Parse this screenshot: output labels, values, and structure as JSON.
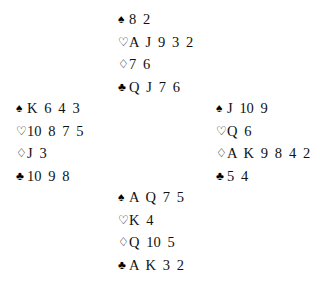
{
  "diagram": {
    "type": "bridge-deal",
    "background_color": "#ffffff",
    "ink_color": "#111111"
  },
  "suits": [
    {
      "key": "spades",
      "name": "spade-suit-symbol",
      "glyph": "♠",
      "filled": true,
      "label": "Spades"
    },
    {
      "key": "hearts",
      "name": "heart-suit-symbol",
      "glyph": "♡",
      "filled": false,
      "label": "Hearts"
    },
    {
      "key": "diamonds",
      "name": "diamond-suit-symbol",
      "glyph": "♢",
      "filled": false,
      "label": "Diamonds"
    },
    {
      "key": "clubs",
      "name": "club-suit-symbol",
      "glyph": "♣",
      "filled": true,
      "label": "Clubs"
    }
  ],
  "hands": {
    "north": {
      "position": "North",
      "spades": {
        "text": "8 2",
        "cards": [
          "8",
          "2"
        ]
      },
      "hearts": {
        "text": "A J 9 3 2",
        "cards": [
          "A",
          "J",
          "9",
          "3",
          "2"
        ]
      },
      "diamonds": {
        "text": "7 6",
        "cards": [
          "7",
          "6"
        ]
      },
      "clubs": {
        "text": "Q J 7 6",
        "cards": [
          "Q",
          "J",
          "7",
          "6"
        ]
      }
    },
    "west": {
      "position": "West",
      "spades": {
        "text": "K 6 4 3",
        "cards": [
          "K",
          "6",
          "4",
          "3"
        ]
      },
      "hearts": {
        "text": "10 8 7 5",
        "cards": [
          "10",
          "8",
          "7",
          "5"
        ]
      },
      "diamonds": {
        "text": "J 3",
        "cards": [
          "J",
          "3"
        ]
      },
      "clubs": {
        "text": "10 9 8",
        "cards": [
          "10",
          "9",
          "8"
        ]
      }
    },
    "east": {
      "position": "East",
      "spades": {
        "text": "J 10 9",
        "cards": [
          "J",
          "10",
          "9"
        ]
      },
      "hearts": {
        "text": "Q 6",
        "cards": [
          "Q",
          "6"
        ]
      },
      "diamonds": {
        "text": "A K 9 8 4 2",
        "cards": [
          "A",
          "K",
          "9",
          "8",
          "4",
          "2"
        ]
      },
      "clubs": {
        "text": "5 4",
        "cards": [
          "5",
          "4"
        ]
      }
    },
    "south": {
      "position": "South",
      "spades": {
        "text": "A Q 7 5",
        "cards": [
          "A",
          "Q",
          "7",
          "5"
        ]
      },
      "hearts": {
        "text": "K 4",
        "cards": [
          "K",
          "4"
        ]
      },
      "diamonds": {
        "text": "Q 10 5",
        "cards": [
          "Q",
          "10",
          "5"
        ]
      },
      "clubs": {
        "text": "A K 3 2",
        "cards": [
          "A",
          "K",
          "3",
          "2"
        ]
      }
    }
  }
}
